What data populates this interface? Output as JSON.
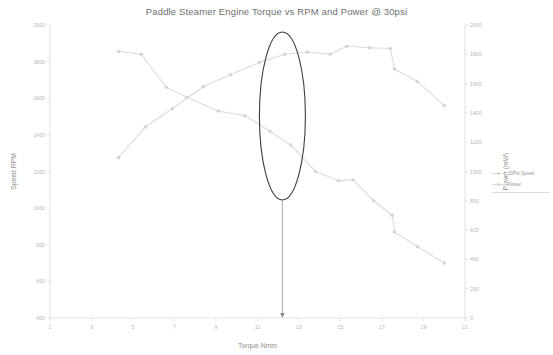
{
  "chart_data": {
    "type": "line",
    "title": "Paddle Steamer Engine Torque vs RPM and Power @ 30psi",
    "xlabel": "Torque Nmm",
    "ylabel": "Speed RPM",
    "y2label": "Power (mW)",
    "grid": false,
    "legend_position": "right",
    "xlim": [
      1,
      21
    ],
    "xticks": [
      1,
      3,
      5,
      7,
      9,
      11,
      13,
      15,
      17,
      19,
      21
    ],
    "ylim": [
      400,
      2000
    ],
    "yticks": [
      400,
      600,
      800,
      1000,
      1200,
      1400,
      1600,
      1800,
      2000
    ],
    "y2lim": [
      0,
      2000
    ],
    "y2ticks": [
      0,
      200,
      400,
      600,
      800,
      1000,
      1200,
      1400,
      1600,
      1800,
      2000
    ],
    "series": [
      {
        "name": "30Psi Speed",
        "axis": "left",
        "color": "#dcdcdc",
        "points": [
          [
            4.3,
            1855
          ],
          [
            5.4,
            1840
          ],
          [
            6.6,
            1660
          ],
          [
            7.6,
            1605
          ],
          [
            9.1,
            1530
          ],
          [
            10.4,
            1505
          ],
          [
            11.6,
            1420
          ],
          [
            12.6,
            1345
          ],
          [
            13.8,
            1200
          ],
          [
            14.9,
            1150
          ],
          [
            15.6,
            1155
          ],
          [
            16.6,
            1040
          ],
          [
            17.5,
            960
          ],
          [
            17.6,
            870
          ],
          [
            18.7,
            790
          ],
          [
            20.0,
            700
          ]
        ]
      },
      {
        "name": "Power",
        "axis": "right",
        "color": "#dcdcdc",
        "points": [
          [
            4.3,
            1095
          ],
          [
            5.6,
            1305
          ],
          [
            6.9,
            1430
          ],
          [
            8.4,
            1580
          ],
          [
            9.7,
            1660
          ],
          [
            11.1,
            1745
          ],
          [
            12.3,
            1800
          ],
          [
            13.4,
            1815
          ],
          [
            14.5,
            1800
          ],
          [
            15.3,
            1855
          ],
          [
            16.4,
            1845
          ],
          [
            17.4,
            1840
          ],
          [
            17.6,
            1700
          ],
          [
            18.7,
            1615
          ],
          [
            20.0,
            1450
          ]
        ]
      }
    ],
    "annotations": [
      {
        "kind": "ellipse",
        "label": "highlight-ellipse",
        "cx": 12.2,
        "cy_px": 116,
        "rx_px": 23,
        "ry_px": 84
      },
      {
        "kind": "arrow",
        "label": "callout-arrow",
        "x": 12.2,
        "from_px": 200,
        "to_px": 318
      }
    ]
  }
}
